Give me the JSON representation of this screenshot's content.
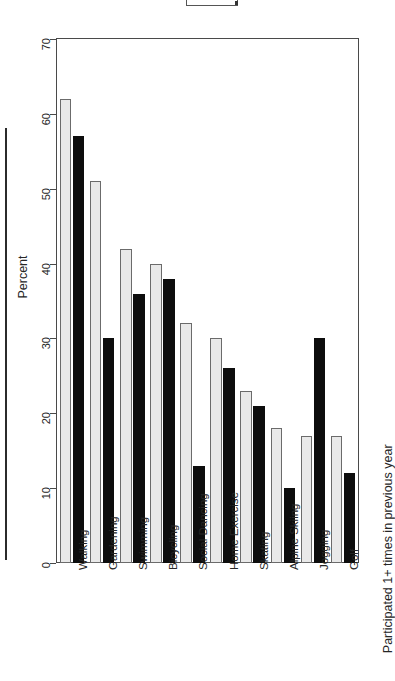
{
  "figure": {
    "caption_right": "Participated 1+ times in previous year",
    "legend_box_label": ""
  },
  "chart_data": {
    "type": "bar",
    "title": "",
    "subtitle": "",
    "xlabel": "",
    "ylabel": "Percent",
    "ylim": [
      0,
      70
    ],
    "yticks": [
      0,
      10,
      20,
      30,
      40,
      50,
      60,
      70
    ],
    "ytick_labels": [
      "0",
      "10",
      "20",
      "30",
      "40",
      "50",
      "60",
      "70"
    ],
    "grid": false,
    "orientation": "vertical-bars-rotated-page",
    "legend": {
      "position": "top",
      "entries": []
    },
    "annotations": [
      "Participated 1+ times in previous year"
    ],
    "categories": [
      "Walking",
      "Gardening",
      "Swimming",
      "Bicycling",
      "Social Dancing",
      "Home Exercise",
      "Skating",
      "Alpine Skiing",
      "Jogging",
      "Golf"
    ],
    "series": [
      {
        "name": "light",
        "color": "#e9e9e9",
        "values": [
          62,
          51,
          42,
          40,
          32,
          30,
          23,
          18,
          17,
          17
        ]
      },
      {
        "name": "dark",
        "color": "#0d0d0d",
        "values": [
          57,
          30,
          36,
          38,
          13,
          26,
          21,
          10,
          30,
          12
        ]
      }
    ]
  }
}
